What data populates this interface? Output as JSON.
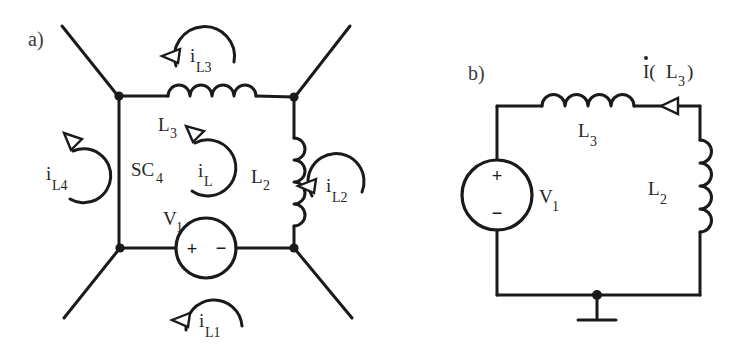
{
  "figure": {
    "background_color": "#ffffff",
    "ink_color": "#1a1a1a",
    "width": 740,
    "height": 350
  },
  "panels": [
    {
      "id": "a",
      "label": "a)",
      "description": "Bridge/mesh circuit with four external diagonal leads, a horizontal inductor L3 on the top branch, a vertical inductor L2 on the right branch, a voltage source V1 on the bottom branch, and five labelled mesh current loops.",
      "components": [
        {
          "name": "inductor-l3",
          "label": "L",
          "subscript": "3",
          "orientation": "horizontal",
          "coils": 4
        },
        {
          "name": "inductor-l2",
          "label": "L",
          "subscript": "2",
          "orientation": "vertical",
          "coils": 4
        },
        {
          "name": "voltage-source-v1",
          "label": "V",
          "subscript": "1",
          "plus": "+",
          "minus": "−",
          "orientation": "horizontal"
        },
        {
          "name": "supernode-label",
          "label": "SC",
          "subscript": "4"
        }
      ],
      "mesh_currents": [
        {
          "name": "current-il3",
          "symbol": "i",
          "subscript": "L3",
          "position": "top"
        },
        {
          "name": "current-il4",
          "symbol": "i",
          "subscript": "L4",
          "position": "left"
        },
        {
          "name": "current-il",
          "symbol": "i",
          "subscript": "L",
          "position": "center"
        },
        {
          "name": "current-il2",
          "symbol": "i",
          "subscript": "L2",
          "position": "right"
        },
        {
          "name": "current-il1",
          "symbol": "i",
          "subscript": "L1",
          "position": "bottom"
        }
      ]
    },
    {
      "id": "b",
      "label": "b)",
      "description": "Single series loop: voltage source V1 on the left branch, inductor L3 on the top branch, inductor L2 on the right branch, ground on the bottom branch, with branch current I(L3) arrow on the top-right wire.",
      "components": [
        {
          "name": "voltage-source-v1",
          "label": "V",
          "subscript": "1",
          "plus": "+",
          "minus": "−",
          "orientation": "vertical"
        },
        {
          "name": "inductor-l3",
          "label": "L",
          "subscript": "3",
          "orientation": "horizontal",
          "coils": 4
        },
        {
          "name": "inductor-l2",
          "label": "L",
          "subscript": "2",
          "orientation": "vertical",
          "coils": 4
        },
        {
          "name": "ground-symbol",
          "label": "",
          "orientation": "down"
        }
      ],
      "branch_current": {
        "name": "current-il3",
        "prefix": "I(",
        "label": "L",
        "subscript": "3",
        "suffix": ")",
        "dot_accent": true,
        "full_text": "I(L3)"
      }
    }
  ]
}
